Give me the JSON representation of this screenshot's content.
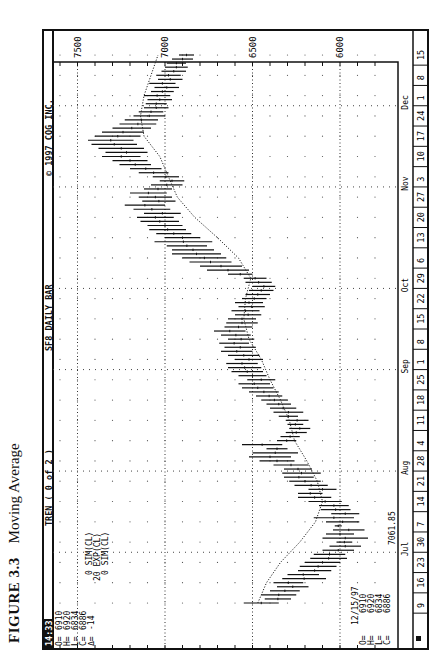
{
  "figure": {
    "label": "FIGURE 3.3",
    "title": "Moving Average"
  },
  "header": {
    "time": "14:33",
    "study": "TREN ( 0 of 2 )",
    "symbol": "SF8 DAILY BAR",
    "copyright": "© 1997 CQG INC."
  },
  "quote_top": {
    "O": "6910",
    "H": "6920",
    "L": "6834",
    "C": "6886",
    "delta": "-14"
  },
  "quote_bottom": {
    "date": "12/15/97",
    "O": "6910",
    "H": "6920",
    "L": "6834",
    "C": "6886"
  },
  "study_labels": [
    "0 SIM(CL)",
    "20 EXP(CL)",
    "0 SIM(CL)"
  ],
  "cursor_label": {
    "value": "7061.85",
    "month": "Jul"
  },
  "chart_data": {
    "type": "ohlc_bar_with_line",
    "title": "SF8 DAILY BAR",
    "xlabel": "Date (1997)",
    "ylabel": "Price",
    "orientation_note": "figure printed rotated 90° counter-clockwise",
    "ylim": [
      5800,
      7650
    ],
    "y_ticks": [
      6000,
      6500,
      7000,
      7500
    ],
    "grid": true,
    "months": [
      {
        "name": "Jul",
        "week_index": 3
      },
      {
        "name": "Aug",
        "week_index": 7
      },
      {
        "name": "Sep",
        "week_index": 12
      },
      {
        "name": "Oct",
        "week_index": 16
      },
      {
        "name": "Nov",
        "week_index": 21
      },
      {
        "name": "Dec",
        "week_index": 25
      }
    ],
    "week_labels": [
      "9",
      "16",
      "23",
      "30",
      "7",
      "14",
      "21",
      "28",
      "4",
      "11",
      "18",
      "25",
      "1",
      "8",
      "15",
      "22",
      "29",
      "6",
      "13",
      "20",
      "27",
      "3",
      "10",
      "17",
      "24",
      "1",
      "8",
      "15"
    ],
    "series": [
      {
        "name": "Daily bar (High/Low range)",
        "type": "bar_range",
        "points": [
          {
            "w": 0.0,
            "lo": 6350,
            "hi": 6550
          },
          {
            "w": 0.2,
            "lo": 6280,
            "hi": 6430
          },
          {
            "w": 0.4,
            "lo": 6250,
            "hi": 6450
          },
          {
            "w": 0.6,
            "lo": 6230,
            "hi": 6400
          },
          {
            "w": 0.8,
            "lo": 6180,
            "hi": 6360
          },
          {
            "w": 1.0,
            "lo": 6210,
            "hi": 6380
          },
          {
            "w": 1.2,
            "lo": 6080,
            "hi": 6330
          },
          {
            "w": 1.4,
            "lo": 6120,
            "hi": 6300
          },
          {
            "w": 1.6,
            "lo": 6050,
            "hi": 6240
          },
          {
            "w": 1.8,
            "lo": 6020,
            "hi": 6230
          },
          {
            "w": 2.0,
            "lo": 6000,
            "hi": 6200
          },
          {
            "w": 2.2,
            "lo": 5960,
            "hi": 6170
          },
          {
            "w": 2.4,
            "lo": 5970,
            "hi": 6150
          },
          {
            "w": 2.6,
            "lo": 5920,
            "hi": 6100
          },
          {
            "w": 2.8,
            "lo": 5880,
            "hi": 6060
          },
          {
            "w": 3.0,
            "lo": 5930,
            "hi": 6020
          },
          {
            "w": 3.2,
            "lo": 5840,
            "hi": 6100
          },
          {
            "w": 3.4,
            "lo": 5920,
            "hi": 6080
          },
          {
            "w": 3.6,
            "lo": 5860,
            "hi": 6040
          },
          {
            "w": 3.8,
            "lo": 5990,
            "hi": 6030
          },
          {
            "w": 4.0,
            "lo": 5890,
            "hi": 6080
          },
          {
            "w": 4.2,
            "lo": 5920,
            "hi": 6150
          },
          {
            "w": 4.4,
            "lo": 5890,
            "hi": 6050
          },
          {
            "w": 4.6,
            "lo": 5940,
            "hi": 6110
          },
          {
            "w": 4.8,
            "lo": 5950,
            "hi": 6120
          },
          {
            "w": 5.0,
            "lo": 5990,
            "hi": 6180
          },
          {
            "w": 5.2,
            "lo": 6050,
            "hi": 6240
          },
          {
            "w": 5.4,
            "lo": 6100,
            "hi": 6240
          },
          {
            "w": 5.6,
            "lo": 6020,
            "hi": 6180
          },
          {
            "w": 5.8,
            "lo": 6070,
            "hi": 6260
          },
          {
            "w": 6.0,
            "lo": 6110,
            "hi": 6290
          },
          {
            "w": 6.2,
            "lo": 6150,
            "hi": 6320
          },
          {
            "w": 6.4,
            "lo": 6110,
            "hi": 6330
          },
          {
            "w": 6.6,
            "lo": 6160,
            "hi": 6320
          },
          {
            "w": 6.8,
            "lo": 6180,
            "hi": 6380
          },
          {
            "w": 7.0,
            "lo": 6260,
            "hi": 6460
          },
          {
            "w": 7.2,
            "lo": 6280,
            "hi": 6520
          },
          {
            "w": 7.4,
            "lo": 6240,
            "hi": 6500
          },
          {
            "w": 7.6,
            "lo": 6300,
            "hi": 6420
          },
          {
            "w": 7.8,
            "lo": 6330,
            "hi": 6560
          },
          {
            "w": 8.0,
            "lo": 6250,
            "hi": 6360
          },
          {
            "w": 8.2,
            "lo": 6230,
            "hi": 6340
          },
          {
            "w": 8.4,
            "lo": 6190,
            "hi": 6310
          },
          {
            "w": 8.6,
            "lo": 6170,
            "hi": 6290
          },
          {
            "w": 8.8,
            "lo": 6210,
            "hi": 6300
          },
          {
            "w": 9.0,
            "lo": 6180,
            "hi": 6310
          },
          {
            "w": 9.2,
            "lo": 6240,
            "hi": 6350
          },
          {
            "w": 9.4,
            "lo": 6210,
            "hi": 6380
          },
          {
            "w": 9.6,
            "lo": 6250,
            "hi": 6400
          },
          {
            "w": 9.8,
            "lo": 6280,
            "hi": 6420
          },
          {
            "w": 10.0,
            "lo": 6300,
            "hi": 6450
          },
          {
            "w": 10.2,
            "lo": 6330,
            "hi": 6480
          },
          {
            "w": 10.4,
            "lo": 6350,
            "hi": 6520
          },
          {
            "w": 10.6,
            "lo": 6380,
            "hi": 6560
          },
          {
            "w": 10.8,
            "lo": 6400,
            "hi": 6580
          },
          {
            "w": 11.0,
            "lo": 6370,
            "hi": 6530
          },
          {
            "w": 11.2,
            "lo": 6420,
            "hi": 6580
          },
          {
            "w": 11.4,
            "lo": 6440,
            "hi": 6620
          },
          {
            "w": 11.6,
            "lo": 6450,
            "hi": 6640
          },
          {
            "w": 11.8,
            "lo": 6470,
            "hi": 6650
          },
          {
            "w": 12.0,
            "lo": 6440,
            "hi": 6600
          },
          {
            "w": 12.2,
            "lo": 6460,
            "hi": 6640
          },
          {
            "w": 12.4,
            "lo": 6500,
            "hi": 6680
          },
          {
            "w": 12.6,
            "lo": 6480,
            "hi": 6660
          },
          {
            "w": 12.8,
            "lo": 6520,
            "hi": 6690
          },
          {
            "w": 13.0,
            "lo": 6490,
            "hi": 6640
          },
          {
            "w": 13.2,
            "lo": 6510,
            "hi": 6680
          },
          {
            "w": 13.4,
            "lo": 6540,
            "hi": 6720
          },
          {
            "w": 13.6,
            "lo": 6500,
            "hi": 6660
          },
          {
            "w": 13.8,
            "lo": 6470,
            "hi": 6650
          },
          {
            "w": 14.0,
            "lo": 6480,
            "hi": 6640
          },
          {
            "w": 14.2,
            "lo": 6450,
            "hi": 6600
          },
          {
            "w": 14.4,
            "lo": 6460,
            "hi": 6620
          },
          {
            "w": 14.6,
            "lo": 6430,
            "hi": 6580
          },
          {
            "w": 14.8,
            "lo": 6440,
            "hi": 6600
          },
          {
            "w": 15.0,
            "lo": 6420,
            "hi": 6560
          },
          {
            "w": 15.2,
            "lo": 6400,
            "hi": 6540
          },
          {
            "w": 15.4,
            "lo": 6380,
            "hi": 6520
          },
          {
            "w": 15.6,
            "lo": 6370,
            "hi": 6500
          },
          {
            "w": 15.8,
            "lo": 6390,
            "hi": 6540
          },
          {
            "w": 16.0,
            "lo": 6420,
            "hi": 6550
          },
          {
            "w": 16.2,
            "lo": 6500,
            "hi": 6640
          },
          {
            "w": 16.4,
            "lo": 6520,
            "hi": 6760
          },
          {
            "w": 16.6,
            "lo": 6560,
            "hi": 6800
          },
          {
            "w": 16.8,
            "lo": 6620,
            "hi": 6860
          },
          {
            "w": 17.0,
            "lo": 6650,
            "hi": 6900
          },
          {
            "w": 17.2,
            "lo": 6680,
            "hi": 6960
          },
          {
            "w": 17.4,
            "lo": 6720,
            "hi": 6960
          },
          {
            "w": 17.6,
            "lo": 6760,
            "hi": 6990
          },
          {
            "w": 17.8,
            "lo": 6730,
            "hi": 7060
          },
          {
            "w": 18.0,
            "lo": 6800,
            "hi": 7000
          },
          {
            "w": 18.2,
            "lo": 6850,
            "hi": 7050
          },
          {
            "w": 18.4,
            "lo": 6880,
            "hi": 7090
          },
          {
            "w": 18.6,
            "lo": 6900,
            "hi": 7100
          },
          {
            "w": 18.8,
            "lo": 6920,
            "hi": 7140
          },
          {
            "w": 19.0,
            "lo": 6950,
            "hi": 7160
          },
          {
            "w": 19.2,
            "lo": 6910,
            "hi": 7120
          },
          {
            "w": 19.4,
            "lo": 6970,
            "hi": 7180
          },
          {
            "w": 19.6,
            "lo": 7000,
            "hi": 7230
          },
          {
            "w": 19.8,
            "lo": 6940,
            "hi": 7130
          },
          {
            "w": 20.0,
            "lo": 6960,
            "hi": 7150
          },
          {
            "w": 20.2,
            "lo": 6990,
            "hi": 7200
          },
          {
            "w": 20.4,
            "lo": 6960,
            "hi": 7120
          },
          {
            "w": 20.6,
            "lo": 6900,
            "hi": 7080
          },
          {
            "w": 20.8,
            "lo": 6890,
            "hi": 7030
          },
          {
            "w": 21.0,
            "lo": 6920,
            "hi": 7070
          },
          {
            "w": 21.2,
            "lo": 6980,
            "hi": 7150
          },
          {
            "w": 21.4,
            "lo": 7020,
            "hi": 7200
          },
          {
            "w": 21.6,
            "lo": 7080,
            "hi": 7260
          },
          {
            "w": 21.8,
            "lo": 7100,
            "hi": 7300
          },
          {
            "w": 22.0,
            "lo": 7140,
            "hi": 7360
          },
          {
            "w": 22.2,
            "lo": 7100,
            "hi": 7340
          },
          {
            "w": 22.4,
            "lo": 7120,
            "hi": 7380
          },
          {
            "w": 22.6,
            "lo": 7160,
            "hi": 7420
          },
          {
            "w": 22.8,
            "lo": 7180,
            "hi": 7440
          },
          {
            "w": 23.0,
            "lo": 7140,
            "hi": 7400
          },
          {
            "w": 23.2,
            "lo": 7120,
            "hi": 7360
          },
          {
            "w": 23.4,
            "lo": 7080,
            "hi": 7300
          },
          {
            "w": 23.6,
            "lo": 7050,
            "hi": 7260
          },
          {
            "w": 23.8,
            "lo": 7040,
            "hi": 7230
          },
          {
            "w": 24.0,
            "lo": 7000,
            "hi": 7180
          },
          {
            "w": 24.2,
            "lo": 7010,
            "hi": 7150
          },
          {
            "w": 24.4,
            "lo": 6980,
            "hi": 7120
          },
          {
            "w": 24.6,
            "lo": 6990,
            "hi": 7110
          },
          {
            "w": 24.8,
            "lo": 6960,
            "hi": 7100
          },
          {
            "w": 25.0,
            "lo": 6970,
            "hi": 7120
          },
          {
            "w": 25.2,
            "lo": 6950,
            "hi": 7080
          },
          {
            "w": 25.4,
            "lo": 6920,
            "hi": 7060
          },
          {
            "w": 25.6,
            "lo": 6940,
            "hi": 7090
          },
          {
            "w": 25.8,
            "lo": 6900,
            "hi": 7040
          },
          {
            "w": 26.0,
            "lo": 6910,
            "hi": 7050
          },
          {
            "w": 26.2,
            "lo": 6880,
            "hi": 7020
          },
          {
            "w": 26.4,
            "lo": 6870,
            "hi": 7000
          },
          {
            "w": 26.6,
            "lo": 6880,
            "hi": 6990
          },
          {
            "w": 26.8,
            "lo": 6840,
            "hi": 6960
          },
          {
            "w": 27.0,
            "lo": 6834,
            "hi": 6920
          }
        ]
      },
      {
        "name": "20 EXP(CL) moving average",
        "type": "line",
        "style": "dotted",
        "points": [
          {
            "w": 0.0,
            "v": 6470
          },
          {
            "w": 1.0,
            "v": 6420
          },
          {
            "w": 2.0,
            "v": 6340
          },
          {
            "w": 3.0,
            "v": 6230
          },
          {
            "w": 4.0,
            "v": 6140
          },
          {
            "w": 5.0,
            "v": 6100
          },
          {
            "w": 6.0,
            "v": 6130
          },
          {
            "w": 7.0,
            "v": 6190
          },
          {
            "w": 8.0,
            "v": 6260
          },
          {
            "w": 9.0,
            "v": 6290
          },
          {
            "w": 10.0,
            "v": 6340
          },
          {
            "w": 11.0,
            "v": 6400
          },
          {
            "w": 12.0,
            "v": 6450
          },
          {
            "w": 13.0,
            "v": 6520
          },
          {
            "w": 14.0,
            "v": 6550
          },
          {
            "w": 15.0,
            "v": 6540
          },
          {
            "w": 16.0,
            "v": 6510
          },
          {
            "w": 17.0,
            "v": 6580
          },
          {
            "w": 18.0,
            "v": 6700
          },
          {
            "w": 19.0,
            "v": 6830
          },
          {
            "w": 20.0,
            "v": 6930
          },
          {
            "w": 21.0,
            "v": 6980
          },
          {
            "w": 22.0,
            "v": 7030
          },
          {
            "w": 23.0,
            "v": 7120
          },
          {
            "w": 24.0,
            "v": 7140
          },
          {
            "w": 25.0,
            "v": 7120
          },
          {
            "w": 26.0,
            "v": 7080
          },
          {
            "w": 27.0,
            "v": 7040
          }
        ]
      }
    ]
  }
}
